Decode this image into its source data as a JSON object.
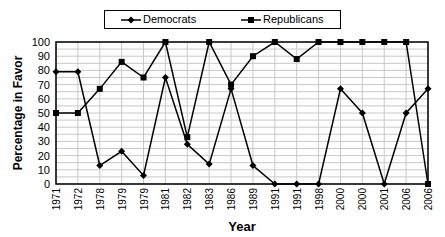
{
  "chart_data": {
    "type": "line",
    "title": "",
    "xlabel": "Year",
    "ylabel": "Percentage in Favor",
    "ylim": [
      0,
      100
    ],
    "yticks": [
      0,
      10,
      20,
      30,
      40,
      50,
      60,
      70,
      80,
      90,
      100
    ],
    "grid": true,
    "legend_position": "top",
    "categories": [
      "1971",
      "1972",
      "1978",
      "1979",
      "1979",
      "1981",
      "1982",
      "1983",
      "1986",
      "1989",
      "1991",
      "1991",
      "1998",
      "2000",
      "2000",
      "2001",
      "2006",
      "2006"
    ],
    "series": [
      {
        "name": "Democrats",
        "marker": "diamond",
        "values": [
          79,
          79,
          13,
          23,
          6,
          75,
          28,
          14,
          67,
          13,
          0,
          0,
          0,
          67,
          50,
          0,
          50,
          67
        ]
      },
      {
        "name": "Republicans",
        "marker": "square",
        "values": [
          50,
          50,
          67,
          86,
          75,
          100,
          33,
          100,
          70,
          90,
          100,
          88,
          100,
          100,
          100,
          100,
          100,
          0
        ]
      }
    ]
  },
  "legend": {
    "items": [
      "Democrats",
      "Republicans"
    ]
  },
  "colors": {
    "line": "#000000",
    "grid": "#c8c8c8",
    "background": "#ffffff"
  }
}
